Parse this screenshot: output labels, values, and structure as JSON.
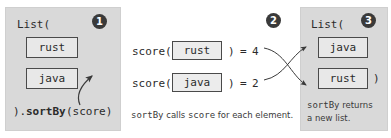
{
  "diagram": {
    "panels": [
      {
        "id": "input-list",
        "badge": "1",
        "header": "List(",
        "items": [
          {
            "label": "rust"
          },
          {
            "label": "java"
          }
        ],
        "footer_prefix": ").",
        "footer_method": "sortBy",
        "footer_suffix": "(score)"
      },
      {
        "id": "score-evaluation",
        "badge": "2",
        "rows": [
          {
            "fn": "score(",
            "arg": "rust",
            "close": ")",
            "equals": "=",
            "result": "4"
          },
          {
            "fn": "score(",
            "arg": "java",
            "close": ")",
            "equals": "=",
            "result": "2"
          }
        ],
        "caption_mono_1": "sortBy",
        "caption_plain_1": " calls ",
        "caption_mono_2": "score",
        "caption_plain_2": " for each element."
      },
      {
        "id": "output-list",
        "badge": "3",
        "header": "List(",
        "items": [
          {
            "label": "java"
          },
          {
            "label": "rust"
          }
        ],
        "close_paren": ")",
        "caption_mono_1": "sortBy",
        "caption_plain_1": " returns",
        "caption_line_2": "a new list."
      }
    ],
    "colors": {
      "panel_background": "#d9d9d9",
      "chip_border": "#4a4a4a",
      "chip_fill": "#e8e8e8",
      "badge_fill": "#3a3a3a",
      "badge_text": "#ffffff",
      "code_text": "#2b2b2b",
      "arrow_stroke": "#3a3a3a",
      "page_background": "#ffffff"
    }
  }
}
